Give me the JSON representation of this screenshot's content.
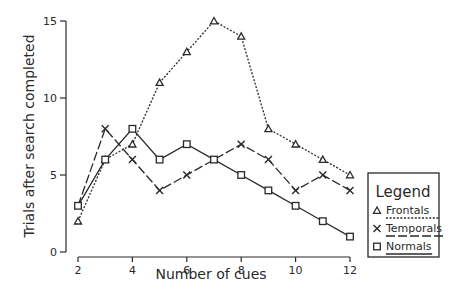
{
  "chart_data": {
    "type": "line",
    "title": "",
    "xlabel": "Number of cues",
    "ylabel": "Trials after search completed",
    "x": [
      2,
      3,
      4,
      5,
      6,
      7,
      8,
      9,
      10,
      11,
      12
    ],
    "xticks": [
      2,
      4,
      6,
      8,
      10,
      12
    ],
    "yticks": [
      0,
      5,
      10,
      15
    ],
    "xlim": [
      2,
      12
    ],
    "ylim": [
      0,
      15
    ],
    "grid": false,
    "legend_position": "right",
    "legend_title": "Legend",
    "series": [
      {
        "name": "Frontals",
        "marker": "triangle",
        "line_style": "dotted",
        "values": [
          2,
          6,
          7,
          11,
          13,
          15,
          14,
          8,
          7,
          6,
          5
        ]
      },
      {
        "name": "Temporals",
        "marker": "x",
        "line_style": "dashed",
        "values": [
          3,
          8,
          6,
          4,
          5,
          6,
          7,
          6,
          4,
          5,
          4
        ]
      },
      {
        "name": "Normals",
        "marker": "square",
        "line_style": "solid",
        "values": [
          3,
          6,
          8,
          6,
          7,
          6,
          5,
          4,
          3,
          2,
          1
        ]
      }
    ],
    "colors": {
      "ink": "#2a2a2a",
      "background": "#ffffff"
    }
  }
}
